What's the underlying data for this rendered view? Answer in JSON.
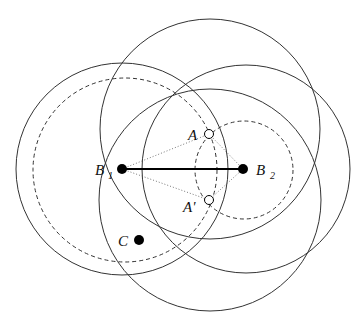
{
  "diagram": {
    "colors": {
      "stroke": "#333333",
      "point": "#000000",
      "background": "#ffffff"
    },
    "circles": [
      {
        "id": "circle-b1-outer",
        "cx": 122,
        "cy": 169,
        "r": 106,
        "style": "solid"
      },
      {
        "id": "circle-b1-dashed",
        "cx": 125,
        "cy": 170,
        "r": 92,
        "style": "dashed"
      },
      {
        "id": "circle-top",
        "cx": 210,
        "cy": 129,
        "r": 110,
        "style": "solid"
      },
      {
        "id": "circle-b2-outer",
        "cx": 246,
        "cy": 169,
        "r": 104,
        "style": "solid"
      },
      {
        "id": "circle-bottom",
        "cx": 210,
        "cy": 200,
        "r": 111,
        "style": "solid"
      },
      {
        "id": "circle-b2-dashed",
        "cx": 244,
        "cy": 170,
        "r": 49,
        "style": "dashed"
      }
    ],
    "points": {
      "B1": {
        "x": 122,
        "y": 169,
        "label": "B",
        "sub": "1",
        "filled": true
      },
      "B2": {
        "x": 243,
        "y": 169,
        "label": "B",
        "sub": "2",
        "filled": true
      },
      "A": {
        "x": 209,
        "y": 134,
        "label": "A",
        "filled": false
      },
      "A_prime": {
        "x": 209,
        "y": 200,
        "label": "A'",
        "filled": false
      },
      "C": {
        "x": 139,
        "y": 240,
        "label": "C",
        "filled": true
      }
    },
    "segment": {
      "from": "B1",
      "to": "B2",
      "style": "thick-solid"
    },
    "dotted_lines": [
      {
        "from": "B1",
        "to": "A"
      },
      {
        "from": "A",
        "to": "B2"
      },
      {
        "from": "B1",
        "to": "A_prime"
      },
      {
        "from": "A_prime",
        "to": "B2"
      }
    ]
  }
}
